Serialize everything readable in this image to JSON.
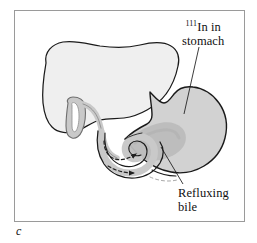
{
  "figure": {
    "caption_letter": "c",
    "panel_label": "c",
    "background_color": "#ffffff",
    "frame_color": "#9a9a9a",
    "outline_color": "#1a1a1a"
  },
  "labels": [
    {
      "id": "indium-stomach",
      "superscript": "111",
      "line1_rest": "In in",
      "line2": "stomach",
      "full_text": "111In in stomach",
      "points_to": "stomach"
    },
    {
      "id": "refluxing-bile",
      "line1": "Refluxing",
      "line2": "bile",
      "full_text": "Refluxing bile",
      "points_to": "bile-in-stomach"
    }
  ],
  "anatomy": [
    {
      "id": "liver",
      "name": "Liver",
      "fill": "#efefef",
      "stroke": "#1a1a1a"
    },
    {
      "id": "gallbladder",
      "name": "Gallbladder",
      "fill": "#c9c9c9",
      "stroke": "#6e6e6e"
    },
    {
      "id": "bile-duct",
      "name": "Common bile duct",
      "fill": "#c9c9c9",
      "stroke": "#6e6e6e"
    },
    {
      "id": "stomach",
      "name": "Stomach",
      "fill": "#d2d2d2",
      "stroke": "#1a1a1a"
    },
    {
      "id": "duodenum",
      "name": "Duodenum",
      "fill": "#c9c9c9",
      "stroke": "#1a1a1a"
    },
    {
      "id": "bile-pool",
      "name": "Refluxed bile pool",
      "fill": "#bcbcbc",
      "stroke": "none"
    }
  ],
  "flow_arrows": [
    {
      "id": "arrow-upper",
      "name": "bile reflux arrow into stomach",
      "style": "dashed",
      "direction": "right-up"
    },
    {
      "id": "arrow-lower",
      "name": "bile flow arrow along duodenum",
      "style": "dashed",
      "direction": "right"
    }
  ]
}
